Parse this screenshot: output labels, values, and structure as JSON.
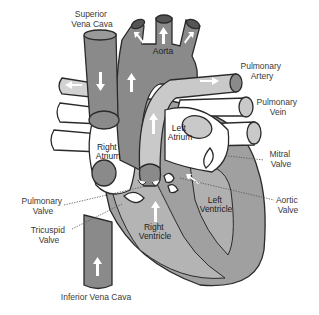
{
  "diagram": {
    "colors": {
      "deoxygenated": "#8a8a8a",
      "oxygenated": "#c9c9c9",
      "muscle": "#9c9c9c",
      "chamber_light": "#ffffff",
      "outline": "#2a2a2a",
      "label": "#3a3a3a"
    },
    "labels": {
      "superior_vena_cava": [
        "Superior",
        "Vena Cava"
      ],
      "aorta": "Aorta",
      "pulmonary_artery": [
        "Pulmonary",
        "Artery"
      ],
      "pulmonary_vein": [
        "Pulmonary",
        "Vein"
      ],
      "left_atrium": [
        "Left",
        "Atrium"
      ],
      "right_atrium": [
        "Right",
        "Atrium"
      ],
      "mitral_valve": [
        "Mitral",
        "Valve"
      ],
      "aortic_valve": [
        "Aortic",
        "Valve"
      ],
      "left_ventricle": [
        "Left",
        "Ventricle"
      ],
      "right_ventricle": [
        "Right",
        "Ventricle"
      ],
      "pulmonary_valve": [
        "Pulmonary",
        "Valve"
      ],
      "tricuspid_valve": [
        "Tricuspid",
        "Valve"
      ],
      "inferior_vena_cava": "Inferior Vena Cava"
    }
  }
}
